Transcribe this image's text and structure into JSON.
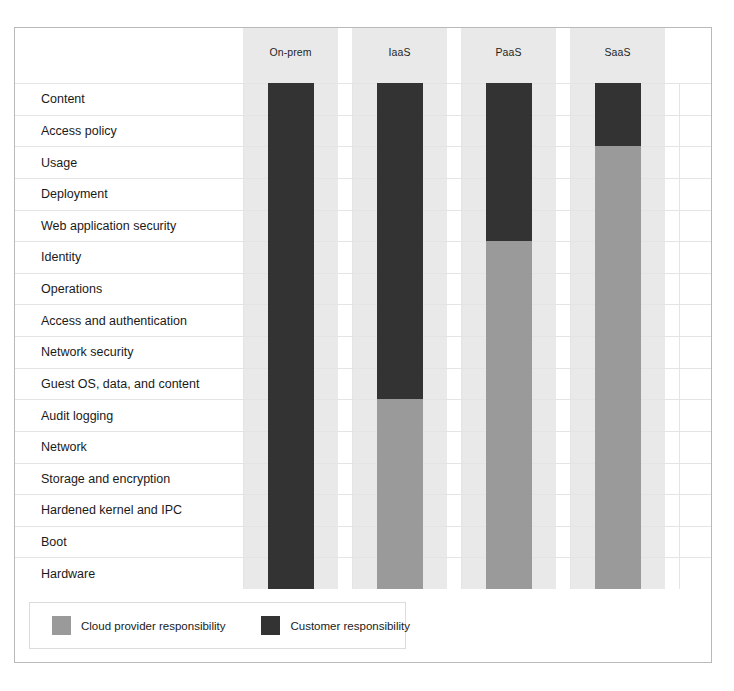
{
  "chart_data": {
    "type": "bar",
    "title": "",
    "subtitle": "",
    "xlabel": "",
    "ylabel": "",
    "grid": true,
    "legend_position": "bottom-left",
    "orientation": "vertical-stacked",
    "categories": [
      "On-prem",
      "IaaS",
      "PaaS",
      "SaaS"
    ],
    "row_labels": [
      "Content",
      "Access policy",
      "Usage",
      "Deployment",
      "Web application security",
      "Identity",
      "Operations",
      "Access and authentication",
      "Network security",
      "Guest OS, data, and content",
      "Audit logging",
      "Network",
      "Storage and encryption",
      "Hardened kernel and IPC",
      "Boot",
      "Hardware"
    ],
    "series": [
      {
        "name": "Customer responsibility",
        "color": "#333333",
        "values": [
          16,
          10,
          5,
          2
        ]
      },
      {
        "name": "Cloud provider responsibility",
        "color": "#9a9a9a",
        "values": [
          0,
          6,
          11,
          14
        ]
      }
    ],
    "stacks": [
      {
        "category": "On-prem",
        "segments": [
          {
            "owner": "Customer responsibility",
            "layers": 16,
            "from": "Content",
            "to": "Hardware"
          }
        ]
      },
      {
        "category": "IaaS",
        "segments": [
          {
            "owner": "Customer responsibility",
            "layers": 10,
            "from": "Content",
            "to": "Guest OS, data, and content"
          },
          {
            "owner": "Cloud provider responsibility",
            "layers": 6,
            "from": "Audit logging",
            "to": "Hardware"
          }
        ]
      },
      {
        "category": "PaaS",
        "segments": [
          {
            "owner": "Customer responsibility",
            "layers": 5,
            "from": "Content",
            "to": "Web application security"
          },
          {
            "owner": "Cloud provider responsibility",
            "layers": 11,
            "from": "Identity",
            "to": "Hardware"
          }
        ]
      },
      {
        "category": "SaaS",
        "segments": [
          {
            "owner": "Customer responsibility",
            "layers": 2,
            "from": "Content",
            "to": "Access policy"
          },
          {
            "owner": "Cloud provider responsibility",
            "layers": 14,
            "from": "Usage",
            "to": "Hardware"
          }
        ]
      }
    ],
    "ylim": [
      0,
      16
    ]
  },
  "columns": [
    {
      "label": "On-prem"
    },
    {
      "label": "IaaS"
    },
    {
      "label": "PaaS"
    },
    {
      "label": "SaaS"
    }
  ],
  "rows": [
    {
      "label": "Content"
    },
    {
      "label": "Access policy"
    },
    {
      "label": "Usage"
    },
    {
      "label": "Deployment"
    },
    {
      "label": "Web application security"
    },
    {
      "label": "Identity"
    },
    {
      "label": "Operations"
    },
    {
      "label": "Access and authentication"
    },
    {
      "label": "Network security"
    },
    {
      "label": "Guest OS, data, and content"
    },
    {
      "label": "Audit logging"
    },
    {
      "label": "Network"
    },
    {
      "label": "Storage and encryption"
    },
    {
      "label": "Hardened kernel and IPC"
    },
    {
      "label": "Boot"
    },
    {
      "label": "Hardware"
    }
  ],
  "legend": {
    "items": [
      {
        "label": "Cloud provider responsibility",
        "color": "#9a9a9a"
      },
      {
        "label": "Customer responsibility",
        "color": "#333333"
      }
    ]
  }
}
